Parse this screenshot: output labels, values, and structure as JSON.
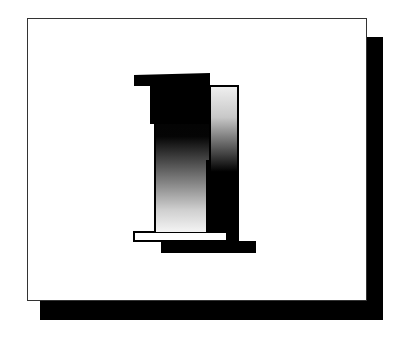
{
  "figure": {
    "glyph": "1",
    "colors": {
      "background": "#ffffff",
      "frame_border": "#333333",
      "shadow": "#000000",
      "gradient_dark": "#000000",
      "gradient_light": "#f4f4f4"
    }
  }
}
